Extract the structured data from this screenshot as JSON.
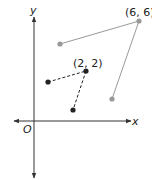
{
  "diagram": {
    "type": "coordinate-plane",
    "axes": {
      "x_label": "x",
      "y_label": "y",
      "origin_label": "O",
      "color": "#333333"
    },
    "gray_figure": {
      "color": "#999999",
      "point_label": "(6, 6)",
      "points": [
        {
          "px": 60,
          "py": 44
        },
        {
          "px": 139,
          "py": 21
        },
        {
          "px": 112,
          "py": 99
        }
      ],
      "segments": [
        [
          0,
          1
        ],
        [
          1,
          2
        ]
      ],
      "line_style": "solid"
    },
    "black_figure": {
      "color": "#222222",
      "point_label": "(2, 2)",
      "points": [
        {
          "px": 48,
          "py": 82
        },
        {
          "px": 86,
          "py": 71
        },
        {
          "px": 73,
          "py": 110
        }
      ],
      "segments": [
        [
          0,
          1
        ],
        [
          1,
          2
        ]
      ],
      "line_style": "dashed"
    }
  }
}
